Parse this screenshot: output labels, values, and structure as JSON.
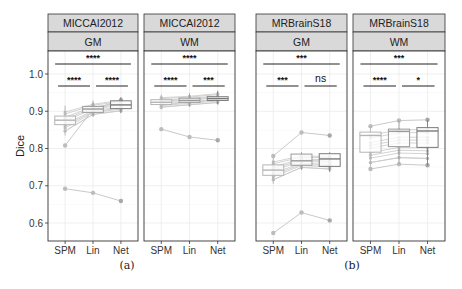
{
  "chart_data": {
    "type": "box",
    "ylabel": "Dice",
    "ylim": [
      0.55,
      1.07
    ],
    "yticks": [
      0.6,
      0.7,
      0.8,
      0.9,
      1.0
    ],
    "ytick_labels": [
      "0.6",
      "0.7",
      "0.8",
      "0.9",
      "1.0"
    ],
    "categories": [
      "SPM",
      "Lin",
      "Net"
    ],
    "grid": true,
    "subfigure_labels": [
      "(a)",
      "(b)"
    ],
    "panels": [
      {
        "group": "(a)",
        "dataset": "MICCAI2012",
        "tissue": "GM",
        "boxes": [
          {
            "category": "SPM",
            "q1": 0.864,
            "median": 0.876,
            "q3": 0.887,
            "whisker_low": 0.835,
            "whisker_high": 0.915
          },
          {
            "category": "Lin",
            "q1": 0.897,
            "median": 0.906,
            "q3": 0.913,
            "whisker_low": 0.885,
            "whisker_high": 0.928
          },
          {
            "category": "Net",
            "q1": 0.907,
            "median": 0.917,
            "q3": 0.928,
            "whisker_low": 0.895,
            "whisker_high": 0.938
          }
        ],
        "outlier_lines": [
          [
            0.808,
            0.905,
            0.93
          ],
          [
            0.692,
            0.681,
            0.659
          ]
        ],
        "significance": [
          {
            "pair": [
              "SPM",
              "Net"
            ],
            "label": "****"
          },
          {
            "pair": [
              "SPM",
              "Lin"
            ],
            "label": "****"
          },
          {
            "pair": [
              "Lin",
              "Net"
            ],
            "label": "****"
          }
        ]
      },
      {
        "group": "(a)",
        "dataset": "MICCAI2012",
        "tissue": "WM",
        "boxes": [
          {
            "category": "SPM",
            "q1": 0.918,
            "median": 0.924,
            "q3": 0.931,
            "whisker_low": 0.905,
            "whisker_high": 0.945
          },
          {
            "category": "Lin",
            "q1": 0.924,
            "median": 0.929,
            "q3": 0.935,
            "whisker_low": 0.912,
            "whisker_high": 0.948
          },
          {
            "category": "Net",
            "q1": 0.929,
            "median": 0.934,
            "q3": 0.939,
            "whisker_low": 0.918,
            "whisker_high": 0.955
          }
        ],
        "outlier_lines": [
          [
            0.852,
            0.831,
            0.822
          ]
        ],
        "significance": [
          {
            "pair": [
              "SPM",
              "Net"
            ],
            "label": "****"
          },
          {
            "pair": [
              "SPM",
              "Lin"
            ],
            "label": "****"
          },
          {
            "pair": [
              "Lin",
              "Net"
            ],
            "label": "***"
          }
        ]
      },
      {
        "group": "(b)",
        "dataset": "MRBrainS18",
        "tissue": "GM",
        "boxes": [
          {
            "category": "SPM",
            "q1": 0.728,
            "median": 0.742,
            "q3": 0.756,
            "whisker_low": 0.705,
            "whisker_high": 0.78
          },
          {
            "category": "Lin",
            "q1": 0.755,
            "median": 0.767,
            "q3": 0.785,
            "whisker_low": 0.742,
            "whisker_high": 0.79
          },
          {
            "category": "Net",
            "q1": 0.752,
            "median": 0.772,
            "q3": 0.786,
            "whisker_low": 0.737,
            "whisker_high": 0.79
          }
        ],
        "outlier_lines": [
          [
            0.78,
            0.843,
            0.835
          ],
          [
            0.573,
            0.628,
            0.607
          ]
        ],
        "significance": [
          {
            "pair": [
              "SPM",
              "Net"
            ],
            "label": "***"
          },
          {
            "pair": [
              "SPM",
              "Lin"
            ],
            "label": "***"
          },
          {
            "pair": [
              "Lin",
              "Net"
            ],
            "label": "ns"
          }
        ]
      },
      {
        "group": "(b)",
        "dataset": "MRBrainS18",
        "tissue": "WM",
        "boxes": [
          {
            "category": "SPM",
            "q1": 0.79,
            "median": 0.835,
            "q3": 0.844,
            "whisker_low": 0.745,
            "whisker_high": 0.86
          },
          {
            "category": "Lin",
            "q1": 0.805,
            "median": 0.846,
            "q3": 0.852,
            "whisker_low": 0.758,
            "whisker_high": 0.875
          },
          {
            "category": "Net",
            "q1": 0.803,
            "median": 0.847,
            "q3": 0.856,
            "whisker_low": 0.755,
            "whisker_high": 0.877
          }
        ],
        "outlier_lines": [
          [
            0.86,
            0.875,
            0.877
          ],
          [
            0.745,
            0.758,
            0.755
          ]
        ],
        "significance": [
          {
            "pair": [
              "SPM",
              "Net"
            ],
            "label": "***"
          },
          {
            "pair": [
              "SPM",
              "Lin"
            ],
            "label": "****"
          },
          {
            "pair": [
              "Lin",
              "Net"
            ],
            "label": "*"
          }
        ]
      }
    ]
  }
}
